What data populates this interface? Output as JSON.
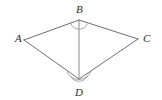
{
  "figure": {
    "type": "geometry-diagram",
    "shape_name": "kite-quadrilateral-with-diagonal",
    "background_color": "#ffffff",
    "stroke_color": "#6e6e6e",
    "arc_color": "#9a9a9a",
    "label_color": "#2b2b2b",
    "vertices": [
      {
        "id": "A",
        "label": "A",
        "x": 24,
        "y": 40,
        "label_x": 15,
        "label_y": 42
      },
      {
        "id": "B",
        "label": "B",
        "x": 79,
        "y": 20,
        "label_x": 76,
        "label_y": 13
      },
      {
        "id": "C",
        "label": "C",
        "x": 138,
        "y": 39,
        "label_x": 143,
        "label_y": 42
      },
      {
        "id": "D",
        "label": "D",
        "x": 79,
        "y": 79,
        "label_x": 75,
        "label_y": 96
      }
    ],
    "edges": [
      {
        "id": "AB",
        "from": "A",
        "to": "B"
      },
      {
        "id": "BC",
        "from": "B",
        "to": "C"
      },
      {
        "id": "CD",
        "from": "C",
        "to": "D"
      },
      {
        "id": "DA",
        "from": "D",
        "to": "A"
      }
    ],
    "diagonal": {
      "id": "BD",
      "from": "B",
      "to": "D"
    },
    "angle_marks": [
      {
        "id": "angle-B",
        "at": "B",
        "arc_count": 1,
        "radius": 9
      },
      {
        "id": "angle-D",
        "at": "D",
        "arc_count": 2,
        "radius": 9,
        "radius_outer": 13
      }
    ]
  }
}
